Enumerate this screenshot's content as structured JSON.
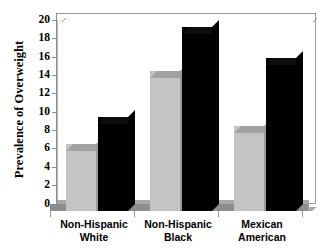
{
  "chart_data": {
    "type": "bar",
    "title": "",
    "subtitle": "",
    "xlabel": "",
    "ylabel": "Prevalence of Overweight",
    "ylim": [
      0,
      20
    ],
    "ytick_step": 2,
    "yticks": [
      "0",
      "2",
      "4",
      "6",
      "8",
      "10",
      "12",
      "14",
      "16",
      "18",
      "20"
    ],
    "grid": false,
    "legend": "none",
    "legend_position": "none",
    "style": "3d-bars-grayscale",
    "categories": [
      {
        "line1": "Non-Hispanic",
        "line2": "White"
      },
      {
        "line1": "Non-Hispanic",
        "line2": "Black"
      },
      {
        "line1": "Mexican",
        "line2": "American"
      }
    ],
    "category_labels": [
      "Non-Hispanic White",
      "Non-Hispanic Black",
      "Mexican American"
    ],
    "series": [
      {
        "name": "series-1",
        "color": "#c4c4c4",
        "values": [
          7.3,
          15.3,
          9.3
        ]
      },
      {
        "name": "series-2",
        "color": "#000000",
        "values": [
          10.2,
          20.0,
          16.7
        ]
      }
    ],
    "colors": {
      "series_1_fill": "#c4c4c4",
      "series_1_top": "#a2a2a2",
      "series_2_fill": "#000000",
      "axis": "#8d8d8d",
      "floor": "#8d8d8d",
      "background": "#ffffff"
    }
  }
}
